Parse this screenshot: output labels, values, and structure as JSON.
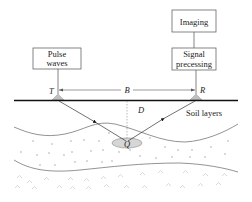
{
  "boxes": {
    "pulse": {
      "line1": "Pulse",
      "line2": "waves"
    },
    "signal": {
      "line1": "Signal",
      "line2": "precessing"
    },
    "imaging": {
      "label": "Imaging"
    }
  },
  "labels": {
    "transmitter": "T",
    "receiver": "R",
    "baseline": "B",
    "depth": "D",
    "target": "Q",
    "soil": "Soil layers"
  },
  "colors": {
    "line": "#222222",
    "box_border": "#666666",
    "target_fill": "#d6d6d6",
    "texture": "#c8c8c8",
    "sensor": "#bbbbbb"
  }
}
